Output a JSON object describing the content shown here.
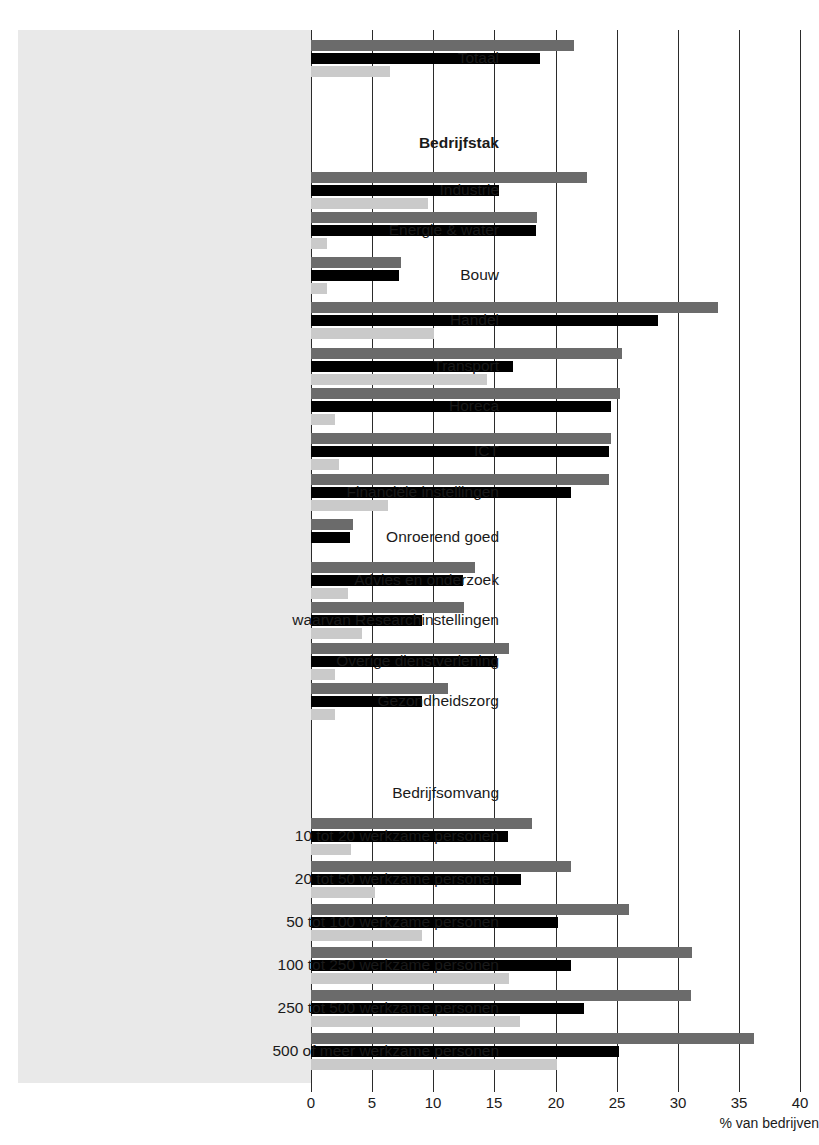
{
  "chart_data": {
    "type": "bar",
    "orientation": "horizontal",
    "title": "",
    "xlabel": "% van bedrijven",
    "ylabel": "",
    "xlim": [
      0,
      40
    ],
    "xticks": [
      0,
      5,
      10,
      15,
      20,
      25,
      30,
      35,
      40
    ],
    "xtick_labels": [
      "0",
      "5",
      "10",
      "15",
      "20",
      "25",
      "30",
      "35",
      "40"
    ],
    "grid": true,
    "legend": [],
    "series": [
      {
        "name": "series-1",
        "color": "#6b6b6b"
      },
      {
        "name": "series-2",
        "color": "#000000"
      },
      {
        "name": "series-3",
        "color": "#cacaca"
      }
    ],
    "rows": [
      {
        "label": "Totaal",
        "kind": "data",
        "values": [
          21.5,
          18.7,
          6.5
        ]
      },
      {
        "label": "Bedrijfstak",
        "kind": "heading",
        "values": []
      },
      {
        "label": "Industrie",
        "kind": "data",
        "values": [
          22.6,
          15.4,
          9.6
        ]
      },
      {
        "label": "Energie & water",
        "kind": "data",
        "values": [
          18.5,
          18.4,
          1.3
        ]
      },
      {
        "label": "Bouw",
        "kind": "data",
        "values": [
          7.4,
          7.2,
          1.3
        ]
      },
      {
        "label": "Handel",
        "kind": "data",
        "values": [
          33.3,
          28.4,
          10.1
        ]
      },
      {
        "label": "Transport",
        "kind": "data",
        "values": [
          25.4,
          16.5,
          14.4
        ]
      },
      {
        "label": "Horeca",
        "kind": "data",
        "values": [
          25.3,
          24.5,
          2.0
        ]
      },
      {
        "label": "ICT",
        "kind": "data",
        "values": [
          24.5,
          24.4,
          2.3
        ]
      },
      {
        "label": "Financiële instellingen",
        "kind": "data",
        "values": [
          24.4,
          21.3,
          6.3
        ]
      },
      {
        "label": "Onroerend goed",
        "kind": "data",
        "values": [
          3.4,
          3.2,
          0.0
        ]
      },
      {
        "label": "Advies en onderzoek",
        "kind": "data",
        "values": [
          13.4,
          12.4,
          3.0
        ]
      },
      {
        "label": "waarvan Researchinstellingen",
        "kind": "data",
        "values": [
          12.5,
          9.1,
          4.2
        ]
      },
      {
        "label": "Overige dienstverlening",
        "kind": "data",
        "values": [
          16.2,
          15.2,
          2.0
        ]
      },
      {
        "label": "Gezondheidszorg",
        "kind": "data",
        "values": [
          11.2,
          9.1,
          2.0
        ]
      },
      {
        "label": "Bedrijfsomvang",
        "kind": "subhead",
        "values": []
      },
      {
        "label": "10 tot 20 werkzame personen",
        "kind": "data",
        "values": [
          18.1,
          16.1,
          3.3
        ]
      },
      {
        "label": "20 tot 50 werkzame personen",
        "kind": "data",
        "values": [
          21.3,
          17.2,
          5.2
        ]
      },
      {
        "label": "50 tot 100 werkzame personen",
        "kind": "data",
        "values": [
          26.0,
          20.2,
          9.1
        ]
      },
      {
        "label": "100 tot 250 werkzame personen",
        "kind": "data",
        "values": [
          31.2,
          21.3,
          16.2
        ]
      },
      {
        "label": "250 tot 500 werkzame personen",
        "kind": "data",
        "values": [
          31.1,
          22.3,
          17.1
        ]
      },
      {
        "label": "500 of meer werkzame personen",
        "kind": "data",
        "values": [
          36.2,
          25.2,
          20.1
        ]
      }
    ]
  },
  "axis": {
    "title": "% van bedrijven"
  },
  "colors": {
    "series_1": "#6b6b6b",
    "series_2": "#000000",
    "series_3": "#cacaca",
    "panel": "#e9e9e9",
    "grid": "#2b2b2b",
    "background": "#ffffff"
  }
}
